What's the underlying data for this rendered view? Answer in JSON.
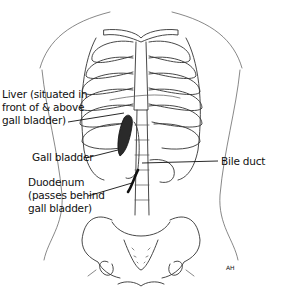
{
  "diagram": {
    "labels": {
      "liver": [
        "Liver (situated in",
        "front of & above",
        "gall bladder)"
      ],
      "gall_bladder": "Gall bladder",
      "duodenum": [
        "Duodenum",
        "(passes behind",
        "gall bladder)"
      ],
      "bile_duct": "Bile duct"
    },
    "signature": "AH",
    "colors": {
      "line": "#333333",
      "text": "#111111",
      "organ_fill": "#2a2a2a",
      "background": "#ffffff"
    }
  }
}
